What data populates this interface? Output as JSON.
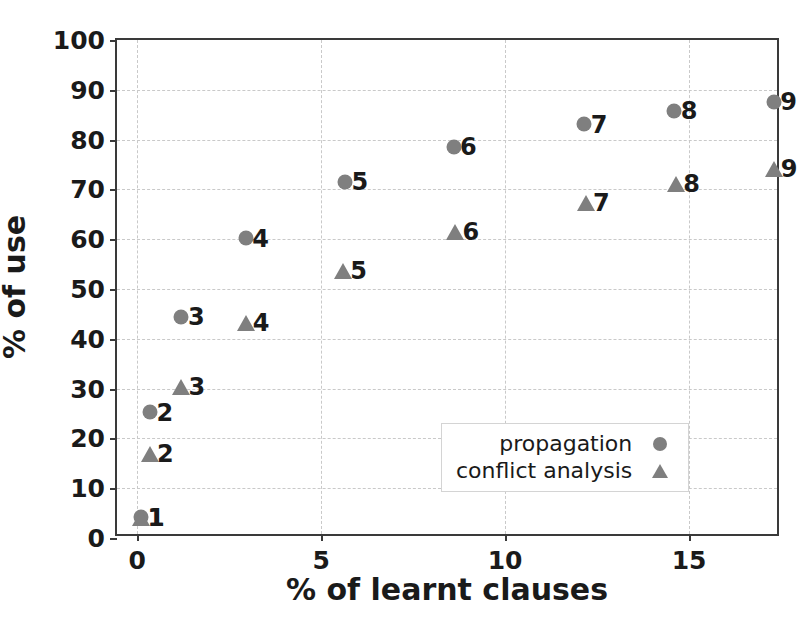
{
  "chart_data": {
    "type": "scatter",
    "title": "",
    "xlabel": "% of learnt clauses",
    "ylabel": "% of use",
    "xlim": [
      -0.55,
      17.5
    ],
    "ylim": [
      0,
      100
    ],
    "xticks": [
      0,
      5,
      10,
      15
    ],
    "yticks": [
      0,
      10,
      20,
      30,
      40,
      50,
      60,
      70,
      80,
      90,
      100
    ],
    "grid": true,
    "legend_position": "lower right",
    "marker_color": "#7f7f7f",
    "series": [
      {
        "name": "propagation",
        "marker": "circle",
        "points": [
          {
            "label": "1",
            "x": 0.1,
            "y": 4.2
          },
          {
            "label": "2",
            "x": 0.35,
            "y": 25.3
          },
          {
            "label": "3",
            "x": 1.2,
            "y": 44.4
          },
          {
            "label": "4",
            "x": 2.95,
            "y": 60.2
          },
          {
            "label": "5",
            "x": 5.65,
            "y": 71.5
          },
          {
            "label": "6",
            "x": 8.6,
            "y": 78.6
          },
          {
            "label": "7",
            "x": 12.15,
            "y": 83.1
          },
          {
            "label": "8",
            "x": 14.6,
            "y": 85.8
          },
          {
            "label": "9",
            "x": 17.3,
            "y": 87.6
          }
        ]
      },
      {
        "name": "conflict analysis",
        "marker": "triangle",
        "points": [
          {
            "label": "1",
            "x": 0.1,
            "y": 4.0
          },
          {
            "label": "2",
            "x": 0.35,
            "y": 16.8
          },
          {
            "label": "3",
            "x": 1.2,
            "y": 30.3
          },
          {
            "label": "4",
            "x": 2.95,
            "y": 43.2
          },
          {
            "label": "5",
            "x": 5.6,
            "y": 53.7
          },
          {
            "label": "6",
            "x": 8.65,
            "y": 61.4
          },
          {
            "label": "7",
            "x": 12.2,
            "y": 67.2
          },
          {
            "label": "8",
            "x": 14.65,
            "y": 71.1
          },
          {
            "label": "9",
            "x": 17.3,
            "y": 74.0
          }
        ]
      }
    ],
    "legend": [
      {
        "text": "propagation",
        "marker": "circle"
      },
      {
        "text": "conflict analysis",
        "marker": "triangle"
      }
    ]
  }
}
